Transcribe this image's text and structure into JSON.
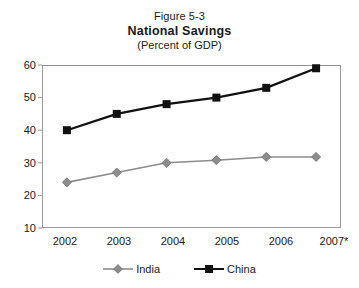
{
  "chart_data": {
    "type": "line",
    "title": "National Savings",
    "figure_number": "Figure 5-3",
    "subtitle": "(Percent of GDP)",
    "xlabel": "",
    "ylabel": "",
    "categories": [
      "2002",
      "2003",
      "2004",
      "2005",
      "2006",
      "2007*"
    ],
    "series": [
      {
        "name": "India",
        "color": "#8c8c8c",
        "marker": "diamond",
        "values": [
          24,
          27,
          30,
          30.8,
          31.8,
          31.8
        ]
      },
      {
        "name": "China",
        "color": "#111111",
        "marker": "square",
        "values": [
          40,
          45,
          48,
          50,
          53,
          59
        ]
      }
    ],
    "ylim": [
      10,
      60
    ],
    "yticks": [
      10,
      20,
      30,
      40,
      50,
      60
    ],
    "ytick_labels": [
      "10",
      "20",
      "30",
      "40",
      "50",
      "60"
    ],
    "grid": false,
    "legend_position": "bottom"
  },
  "legend": {
    "items": [
      {
        "label": "India"
      },
      {
        "label": "China"
      }
    ]
  }
}
